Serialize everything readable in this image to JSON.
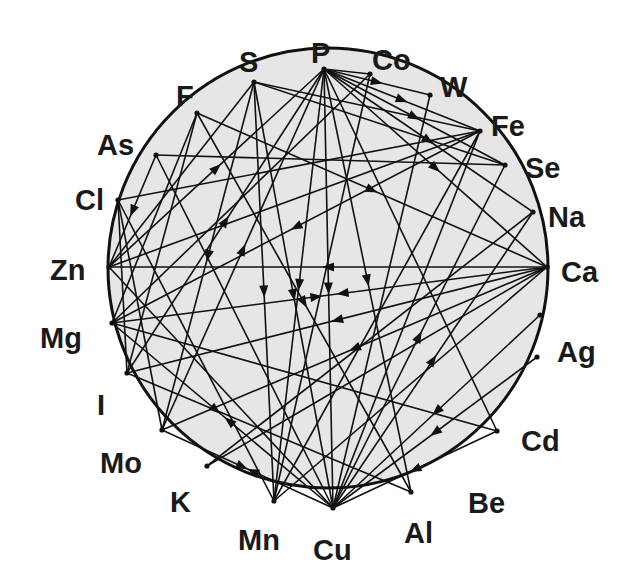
{
  "diagram": {
    "type": "mineral-interaction-wheel",
    "circle": {
      "cx": 328,
      "cy": 268,
      "r": 220,
      "fill": "#e6e6e6",
      "stroke": "#111111"
    },
    "nodes": [
      {
        "id": "P",
        "label": "P",
        "x": 324,
        "y": 69,
        "lx": 311,
        "ly": 53
      },
      {
        "id": "Co",
        "label": "Co",
        "x": 370,
        "y": 74,
        "lx": 372,
        "ly": 60
      },
      {
        "id": "W",
        "label": "W",
        "x": 430,
        "y": 95,
        "lx": 440,
        "ly": 87
      },
      {
        "id": "Fe",
        "label": "Fe",
        "x": 480,
        "y": 131,
        "lx": 491,
        "ly": 126
      },
      {
        "id": "Se",
        "label": "Se",
        "x": 505,
        "y": 165,
        "lx": 525,
        "ly": 168
      },
      {
        "id": "Na",
        "label": "Na",
        "x": 533,
        "y": 212,
        "lx": 548,
        "ly": 217
      },
      {
        "id": "Ca",
        "label": "Ca",
        "x": 547,
        "y": 267,
        "lx": 561,
        "ly": 272
      },
      {
        "id": "Ag",
        "label": "Ag",
        "x": 540,
        "y": 315,
        "lx": 557,
        "ly": 352
      },
      {
        "id": "Cd",
        "label": "Cd",
        "x": 537,
        "y": 357,
        "lx": 521,
        "ly": 441
      },
      {
        "id": "Be",
        "label": "Be",
        "x": 497,
        "y": 431,
        "lx": 468,
        "ly": 503
      },
      {
        "id": "Al",
        "label": "Al",
        "x": 411,
        "y": 492,
        "lx": 404,
        "ly": 533
      },
      {
        "id": "Cu",
        "label": "Cu",
        "x": 333,
        "y": 508,
        "lx": 313,
        "ly": 550
      },
      {
        "id": "Mn",
        "label": "Mn",
        "x": 274,
        "y": 501,
        "lx": 238,
        "ly": 540
      },
      {
        "id": "K",
        "label": "K",
        "x": 207,
        "y": 466,
        "lx": 170,
        "ly": 502
      },
      {
        "id": "Mo",
        "label": "Mo",
        "x": 162,
        "y": 430,
        "lx": 100,
        "ly": 463
      },
      {
        "id": "I",
        "label": "I",
        "x": 127,
        "y": 373,
        "lx": 97,
        "ly": 405
      },
      {
        "id": "Mg",
        "label": "Mg",
        "x": 112,
        "y": 323,
        "lx": 40,
        "ly": 338
      },
      {
        "id": "Zn",
        "label": "Zn",
        "x": 109,
        "y": 267,
        "lx": 50,
        "ly": 270
      },
      {
        "id": "Cl",
        "label": "Cl",
        "x": 118,
        "y": 200,
        "lx": 75,
        "ly": 200
      },
      {
        "id": "As",
        "label": "As",
        "x": 156,
        "y": 155,
        "lx": 97,
        "ly": 145
      },
      {
        "id": "F",
        "label": "F",
        "x": 197,
        "y": 113,
        "lx": 176,
        "ly": 96
      },
      {
        "id": "S",
        "label": "S",
        "x": 254,
        "y": 82,
        "lx": 239,
        "ly": 62
      }
    ],
    "edges": [
      {
        "from": "P",
        "to": "Co",
        "arrow": "none"
      },
      {
        "from": "P",
        "to": "W",
        "arrow": "to"
      },
      {
        "from": "P",
        "to": "Fe",
        "arrow": "to"
      },
      {
        "from": "P",
        "to": "Se",
        "arrow": "to"
      },
      {
        "from": "P",
        "to": "Na",
        "arrow": "to"
      },
      {
        "from": "P",
        "to": "Ca",
        "arrow": "to"
      },
      {
        "from": "P",
        "to": "Al",
        "arrow": "to"
      },
      {
        "from": "P",
        "to": "Cu",
        "arrow": "to"
      },
      {
        "from": "P",
        "to": "Mn",
        "arrow": "to"
      },
      {
        "from": "P",
        "to": "Mo",
        "arrow": "from"
      },
      {
        "from": "P",
        "to": "I",
        "arrow": "from"
      },
      {
        "from": "P",
        "to": "Zn",
        "arrow": "from"
      },
      {
        "from": "P",
        "to": "Be",
        "arrow": "none"
      },
      {
        "from": "S",
        "to": "Fe",
        "arrow": "none"
      },
      {
        "from": "S",
        "to": "Mo",
        "arrow": "to"
      },
      {
        "from": "S",
        "to": "Cu",
        "arrow": "to"
      },
      {
        "from": "S",
        "to": "Mn",
        "arrow": "to"
      },
      {
        "from": "S",
        "to": "Zn",
        "arrow": "none"
      },
      {
        "from": "S",
        "to": "Se",
        "arrow": "none"
      },
      {
        "from": "F",
        "to": "Ca",
        "arrow": "to"
      },
      {
        "from": "F",
        "to": "Al",
        "arrow": "to"
      },
      {
        "from": "F",
        "to": "Mg",
        "arrow": "none"
      },
      {
        "from": "F",
        "to": "I",
        "arrow": "none"
      },
      {
        "from": "As",
        "to": "Se",
        "arrow": "none"
      },
      {
        "from": "As",
        "to": "Zn",
        "arrow": "to"
      },
      {
        "from": "Co",
        "to": "Mn",
        "arrow": "none"
      },
      {
        "from": "Co",
        "to": "Mg",
        "arrow": "none"
      },
      {
        "from": "W",
        "to": "Cu",
        "arrow": "none"
      },
      {
        "from": "Fe",
        "to": "Zn",
        "arrow": "none"
      },
      {
        "from": "Fe",
        "to": "Mn",
        "arrow": "none"
      },
      {
        "from": "Fe",
        "to": "Cu",
        "arrow": "none"
      },
      {
        "from": "Fe",
        "to": "Mg",
        "arrow": "to"
      },
      {
        "from": "Fe",
        "to": "Cl",
        "arrow": "none"
      },
      {
        "from": "Ca",
        "to": "Zn",
        "arrow": "to"
      },
      {
        "from": "Ca",
        "to": "Mg",
        "arrow": "both"
      },
      {
        "from": "Ca",
        "to": "Mo",
        "arrow": "to"
      },
      {
        "from": "Ca",
        "to": "K",
        "arrow": "none"
      },
      {
        "from": "Ca",
        "to": "Mn",
        "arrow": "none"
      },
      {
        "from": "Ca",
        "to": "I",
        "arrow": "to"
      },
      {
        "from": "Ag",
        "to": "Cu",
        "arrow": "to"
      },
      {
        "from": "Cd",
        "to": "Cu",
        "arrow": "to"
      },
      {
        "from": "Be",
        "to": "Cu",
        "arrow": "to"
      },
      {
        "from": "Na",
        "to": "K",
        "arrow": "none"
      },
      {
        "from": "Zn",
        "to": "Cu",
        "arrow": "none"
      },
      {
        "from": "Mg",
        "to": "Cu",
        "arrow": "both"
      },
      {
        "from": "Mg",
        "to": "Be",
        "arrow": "none"
      },
      {
        "from": "Mo",
        "to": "Cu",
        "arrow": "both"
      },
      {
        "from": "Mo",
        "to": "Cl",
        "arrow": "none"
      },
      {
        "from": "I",
        "to": "Cl",
        "arrow": "none"
      },
      {
        "from": "I",
        "to": "Al",
        "arrow": "none"
      },
      {
        "from": "Mn",
        "to": "Cl",
        "arrow": "none"
      },
      {
        "from": "Cu",
        "to": "As",
        "arrow": "none"
      },
      {
        "from": "Cu",
        "to": "Se",
        "arrow": "to"
      },
      {
        "from": "Cu",
        "to": "Na",
        "arrow": "to"
      }
    ]
  }
}
